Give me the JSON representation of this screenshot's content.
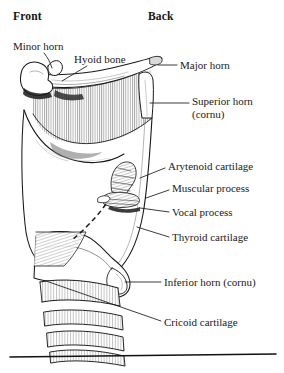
{
  "figure": {
    "kind": "anatomical-line-drawing",
    "style": "black-and-white pen-and-ink hatched illustration",
    "background_color": "#ffffff",
    "ink_color": "#1a1a1a",
    "baseline_rule": true
  },
  "orientation": {
    "front": "Front",
    "back": "Back"
  },
  "labels": [
    {
      "id": "minor-horn",
      "text": "Minor horn",
      "lines": [
        "Minor horn"
      ],
      "x": 13,
      "y": 40,
      "leader": "M 44 53 C 48 58, 50 62, 52 68",
      "target": "lesser cornu of hyoid bone"
    },
    {
      "id": "hyoid-bone",
      "text": "Hyoid bone",
      "lines": [
        "Hyoid bone"
      ],
      "x": 74,
      "y": 53,
      "leader": "M 87 66 L 62 81",
      "target": "body of hyoid bone"
    },
    {
      "id": "major-horn",
      "text": "Major horn",
      "lines": [
        "Major horn"
      ],
      "x": 180,
      "y": 59,
      "leader": "M 177 65 L 158 65",
      "target": "greater cornu of hyoid bone"
    },
    {
      "id": "superior-horn",
      "text": "Superior horn (cornu)",
      "lines": [
        "Superior horn",
        "(cornu)"
      ],
      "x": 192,
      "y": 95,
      "leader": "M 189 103 L 150 103",
      "target": "superior horn of thyroid cartilage"
    },
    {
      "id": "arytenoid-cartilage",
      "text": "Arytenoid cartilage",
      "lines": [
        "Arytenoid cartilage"
      ],
      "x": 168,
      "y": 160,
      "leader": "M 165 168 L 140 178",
      "target": "arytenoid cartilage"
    },
    {
      "id": "muscular-process",
      "text": "Muscular process",
      "lines": [
        "Muscular process"
      ],
      "x": 172,
      "y": 182,
      "leader": "M 169 190 L 146 198",
      "target": "muscular process of arytenoid"
    },
    {
      "id": "vocal-process",
      "text": "Vocal process",
      "lines": [
        "Vocal process"
      ],
      "x": 172,
      "y": 206,
      "leader": "M 169 212 L 140 208",
      "target": "vocal process of arytenoid"
    },
    {
      "id": "thyroid-cartilage",
      "text": "Thyroid cartilage",
      "lines": [
        "Thyroid cartilage"
      ],
      "x": 172,
      "y": 231,
      "leader": "M 169 237 L 137 227",
      "target": "lamina of thyroid cartilage"
    },
    {
      "id": "inferior-horn",
      "text": "Inferior horn (cornu)",
      "lines": [
        "Inferior horn (cornu)"
      ],
      "x": 164,
      "y": 276,
      "leader": "M 161 282 L 125 282",
      "target": "inferior horn of thyroid cartilage"
    },
    {
      "id": "cricoid-cartilage",
      "text": "Cricoid cartilage",
      "lines": [
        "Cricoid cartilage"
      ],
      "x": 164,
      "y": 316,
      "leader": "M 161 321 L 46 281",
      "target": "cricoid cartilage"
    }
  ],
  "structures": [
    "hyoid bone",
    "lesser cornu",
    "greater cornu",
    "thyrohyoid membrane",
    "thyroid cartilage lamina",
    "superior horn of thyroid cartilage",
    "inferior horn of thyroid cartilage",
    "arytenoid cartilage",
    "muscular process",
    "vocal process",
    "vocal ligament (dashed)",
    "cricoid cartilage",
    "tracheal rings"
  ]
}
